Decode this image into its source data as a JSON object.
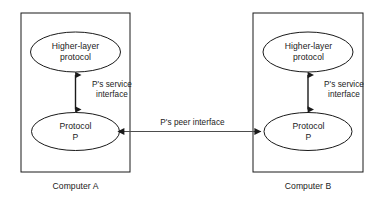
{
  "diagram": {
    "type": "protocol-layering-diagram",
    "background_color": "#ffffff",
    "stroke_color": "#1a1a1a",
    "text_color": "#1a1a1a",
    "containers": [
      {
        "id": "computer-a",
        "caption": "Computer A",
        "nodes": [
          {
            "id": "higher-layer-protocol-a",
            "label": "Higher-layer\nprotocol",
            "shape": "ellipse"
          },
          {
            "id": "protocol-p-a",
            "label": "Protocol\nP",
            "shape": "ellipse"
          }
        ],
        "edges": [
          {
            "id": "service-interface-a",
            "label": "P's service\ninterface",
            "arrow": "double-vertical"
          }
        ]
      },
      {
        "id": "computer-b",
        "caption": "Computer B",
        "nodes": [
          {
            "id": "higher-layer-protocol-b",
            "label": "Higher-layer\nprotocol",
            "shape": "ellipse"
          },
          {
            "id": "protocol-p-b",
            "label": "Protocol\nP",
            "shape": "ellipse"
          }
        ],
        "edges": [
          {
            "id": "service-interface-b",
            "label": "P's service\ninterface",
            "arrow": "double-vertical"
          }
        ]
      }
    ],
    "peer_edge": {
      "id": "peer-interface",
      "label": "P's peer interface",
      "arrow": "double-horizontal"
    }
  }
}
